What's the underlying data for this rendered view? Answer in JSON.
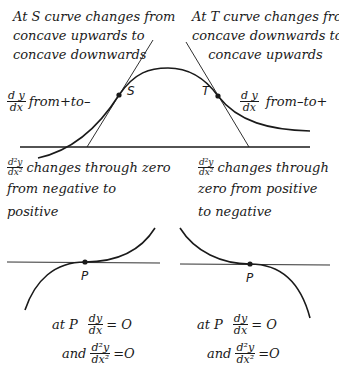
{
  "top_left": {
    "caption_lines": [
      "At S curve changes from",
      "concave upwards to",
      "concave downwards"
    ],
    "derivative": {
      "num": "d y",
      "den": "dx"
    },
    "derivative_text": "from+to–",
    "point_label": "S"
  },
  "top_right": {
    "caption_lines": [
      "At T curve changes from",
      "concave downwards to",
      "concave upwards"
    ],
    "derivative": {
      "num": "d y",
      "den": "dx"
    },
    "derivative_text": "from–to+",
    "point_label": "T"
  },
  "bottom_left": {
    "second_derivative": {
      "num": "d²y",
      "den": "dx²"
    },
    "caption_lines": [
      "changes through zero",
      "from negative to",
      "positive"
    ],
    "point_label": "P",
    "eq1": {
      "prefix": "at P",
      "num": "dy",
      "den": "dx",
      "rhs": "= O"
    },
    "eq2": {
      "prefix": "and",
      "num": "d²y",
      "den": "dx²",
      "rhs": "=O"
    }
  },
  "bottom_right": {
    "second_derivative": {
      "num": "d²y",
      "den": "dx²"
    },
    "caption_lines": [
      "changes through",
      "zero from positive",
      "to negative"
    ],
    "point_label": "P",
    "eq1": {
      "prefix": "at P",
      "num": "dy",
      "den": "dx",
      "rhs": "= O"
    },
    "eq2": {
      "prefix": "and",
      "num": "d²y",
      "den": "dx²",
      "rhs": "=O"
    }
  },
  "colors": {
    "ink": "#1a1a1a",
    "background": "#ffffff"
  }
}
